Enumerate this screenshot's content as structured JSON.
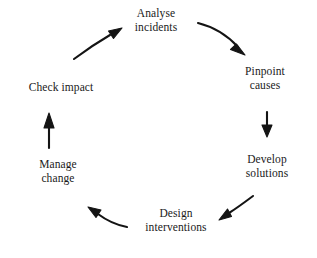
{
  "diagram": {
    "type": "cycle",
    "direction": "clockwise",
    "background_color": "#ffffff",
    "text_color": "#1a1a1a",
    "arrow_color": "#141414",
    "nodes": [
      {
        "id": "analyse-incidents",
        "lines": [
          "Analyse",
          "incidents"
        ],
        "line1": "Analyse",
        "line2": "incidents",
        "cx": 156,
        "cy": 21,
        "position": "top"
      },
      {
        "id": "pinpoint-causes",
        "lines": [
          "Pinpoint",
          "causes"
        ],
        "line1": "Pinpoint",
        "line2": "causes",
        "cx": 265,
        "cy": 79,
        "position": "upper-right"
      },
      {
        "id": "develop-solutions",
        "lines": [
          "Develop",
          "solutions"
        ],
        "line1": "Develop",
        "line2": "solutions",
        "cx": 267,
        "cy": 167,
        "position": "lower-right"
      },
      {
        "id": "design-interventions",
        "lines": [
          "Design",
          "interventions"
        ],
        "line1": "Design",
        "line2": "interventions",
        "cx": 176,
        "cy": 221,
        "position": "bottom"
      },
      {
        "id": "manage-change",
        "lines": [
          "Manage",
          "change"
        ],
        "line1": "Manage",
        "line2": "change",
        "cx": 58,
        "cy": 172,
        "position": "lower-left"
      },
      {
        "id": "check-impact",
        "lines": [
          "Check impact"
        ],
        "line1": "Check impact",
        "line2": "",
        "cx": 61,
        "cy": 88,
        "position": "upper-left"
      }
    ],
    "arrows": [
      {
        "id": "arrow-analyse-to-pinpoint",
        "from": "analyse-incidents",
        "to": "pinpoint-causes",
        "style": "curved",
        "label": ""
      },
      {
        "id": "arrow-pinpoint-to-develop",
        "from": "pinpoint-causes",
        "to": "develop-solutions",
        "style": "straight-vertical-down",
        "label": ""
      },
      {
        "id": "arrow-develop-to-design",
        "from": "develop-solutions",
        "to": "design-interventions",
        "style": "curved",
        "label": ""
      },
      {
        "id": "arrow-design-to-manage",
        "from": "design-interventions",
        "to": "manage-change",
        "style": "curved",
        "label": ""
      },
      {
        "id": "arrow-manage-to-check",
        "from": "manage-change",
        "to": "check-impact",
        "style": "straight-vertical-up",
        "label": ""
      },
      {
        "id": "arrow-check-to-analyse",
        "from": "check-impact",
        "to": "analyse-incidents",
        "style": "curved",
        "label": ""
      }
    ]
  }
}
